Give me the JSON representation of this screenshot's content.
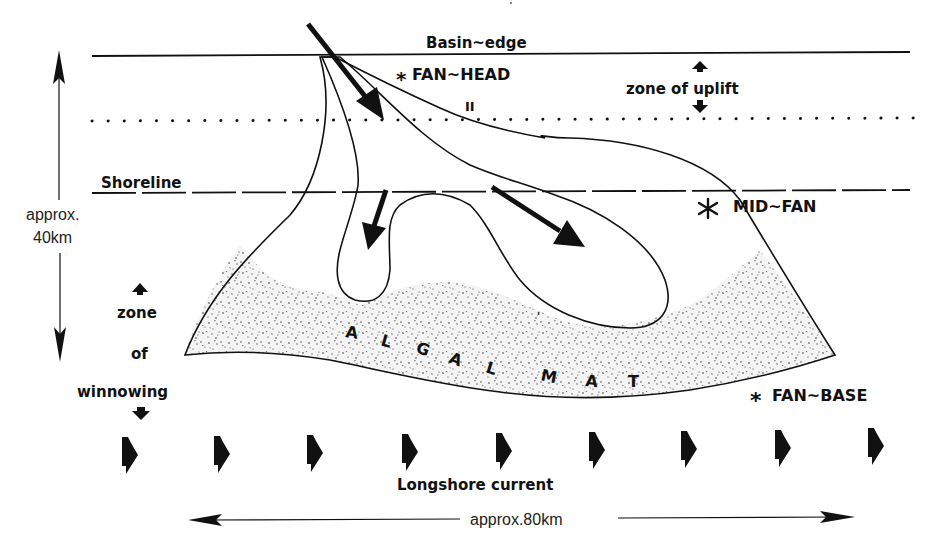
{
  "labels": {
    "basin_edge": "Basin~edge",
    "fan_head": "FAN~HEAD",
    "fan_head_marker": "*",
    "fan_head_mark_ii": "II",
    "zone_of_uplift": "zone of uplift",
    "shoreline": "Shoreline",
    "mid_fan": "MID~FAN",
    "mid_fan_marker": "*",
    "fan_base": "FAN~BASE",
    "fan_base_marker": "*",
    "zone_of_winnowing": {
      "line1": "zone",
      "line2": "of",
      "line3": "winnowing"
    },
    "algal_mat_letters": [
      "A",
      "L",
      "G",
      "A",
      "L",
      "M",
      "A",
      "T"
    ],
    "algal_mat": "ALGAL MAT",
    "longshore_current": "Longshore current",
    "vertical_scale": {
      "line1": "approx.",
      "line2": "40km"
    },
    "horizontal_scale": "approx.80km"
  },
  "legend_patterns": {
    "conglomerate": "pebble-stipple pattern (fan channels)",
    "algal_mat": "dense stipple pattern (fan base)"
  },
  "longshore_arrows_count": 9,
  "colors": {
    "ink": "#111111",
    "paper": "#ffffff",
    "stipple": "#555555"
  }
}
